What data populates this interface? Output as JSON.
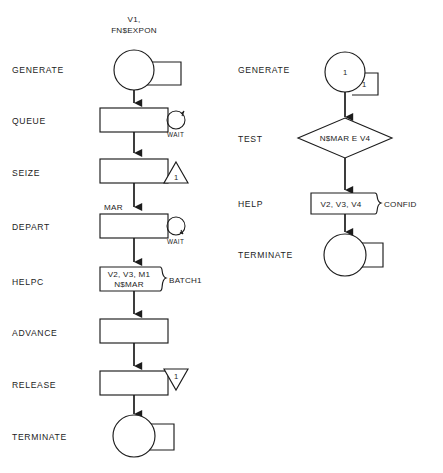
{
  "diagram": {
    "columns": [
      {
        "name": "left-column",
        "rows": [
          {
            "block_label": "GENERATE",
            "symbol": "generate-circle-with-box",
            "operand_above": "V1,\nFN$EXPON",
            "operand_line1": "V1,",
            "operand_line2": "FN$EXPON",
            "inside_text": "",
            "box_text": "",
            "side_label": ""
          },
          {
            "block_label": "QUEUE",
            "symbol": "rect-with-loop-circle",
            "inside_text": "",
            "side_label": "WAIT"
          },
          {
            "block_label": "SEIZE",
            "symbol": "rect-with-up-triangle",
            "inside_text": "",
            "triangle_text": "1"
          },
          {
            "block_label": "DEPART",
            "symbol": "rect-with-loop-circle",
            "above_text": "MAR",
            "inside_text": "",
            "side_label": "WAIT"
          },
          {
            "block_label": "HELPC",
            "symbol": "rect-with-curly-right",
            "inside_line1": "V2, V3, M1",
            "inside_line2": "N$MAR",
            "side_label": "BATCH1"
          },
          {
            "block_label": "ADVANCE",
            "symbol": "rect",
            "inside_text": ""
          },
          {
            "block_label": "RELEASE",
            "symbol": "rect-with-down-triangle",
            "inside_text": "",
            "triangle_text": "1"
          },
          {
            "block_label": "TERMINATE",
            "symbol": "terminate-circle-with-box",
            "inside_text": "",
            "box_text": ""
          }
        ]
      },
      {
        "name": "right-column",
        "rows": [
          {
            "block_label": "GENERATE",
            "symbol": "generate-circle-with-box",
            "inside_text": "1",
            "box_text": "1"
          },
          {
            "block_label": "TEST",
            "symbol": "diamond",
            "inside_text": "N$MAR E V4"
          },
          {
            "block_label": "HELP",
            "symbol": "rect-with-curly-right",
            "inside_line1": "V2, V3, V4",
            "side_label": "CONFID"
          },
          {
            "block_label": "TERMINATE",
            "symbol": "terminate-circle-with-box",
            "inside_text": "",
            "box_text": ""
          }
        ]
      }
    ],
    "colors": {
      "stroke": "#1c1c1c",
      "fill": "#ffffff",
      "background": "#ffffff"
    }
  }
}
